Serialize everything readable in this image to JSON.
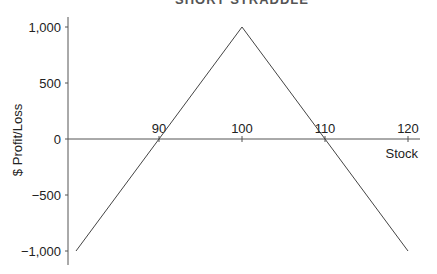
{
  "chart_data": {
    "type": "line",
    "title": "SHORT STRADDLE",
    "xlabel": "Stock",
    "ylabel": "$ Profit/Loss",
    "x": [
      80,
      100,
      120
    ],
    "series": [
      {
        "name": "Payoff",
        "values": [
          -1000,
          1000,
          -1000
        ]
      }
    ],
    "x_ticks": [
      90,
      100,
      110,
      120
    ],
    "y_ticks": [
      1000,
      500,
      0,
      -500,
      -1000
    ],
    "y_tick_labels": [
      "1,000",
      "500",
      "0",
      "−500",
      "−1,000"
    ],
    "x_tick_labels": [
      "90",
      "100",
      "110",
      "120"
    ],
    "xlim": [
      80,
      120
    ],
    "ylim": [
      -1000,
      1000
    ],
    "breakeven_points": [
      90,
      110
    ],
    "grid": false,
    "line_color": "#444444"
  }
}
